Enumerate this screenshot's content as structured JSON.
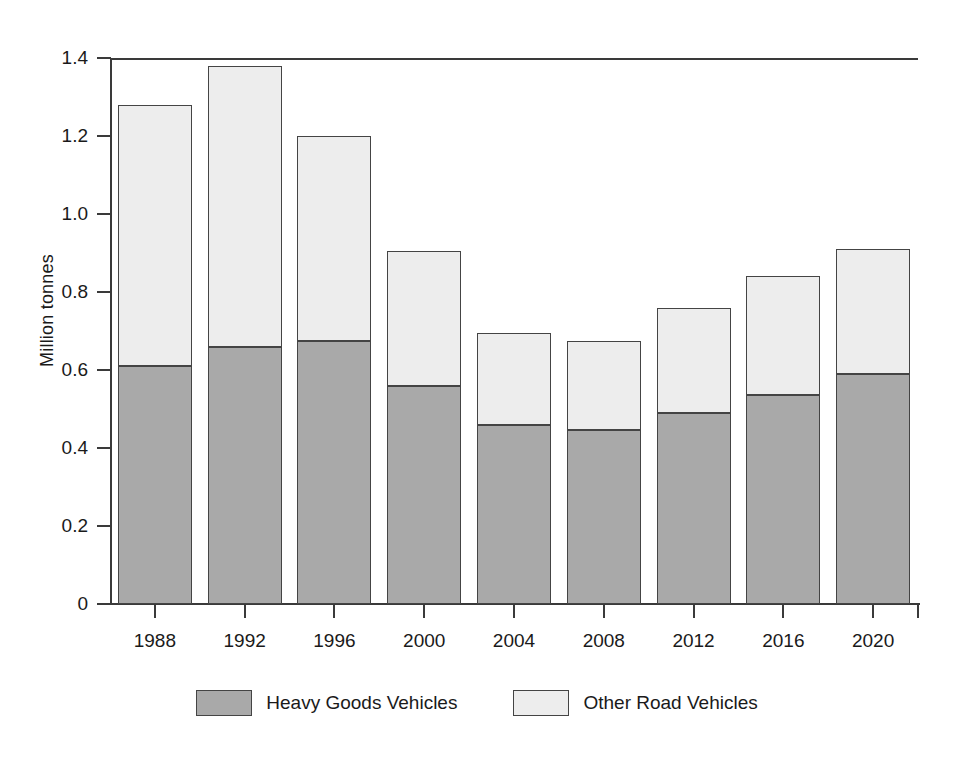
{
  "chart_data": {
    "type": "bar",
    "subtype": "stacked-bar",
    "title": "",
    "xlabel": "",
    "ylabel": "Million tonnes",
    "categories": [
      "1988",
      "1992",
      "1996",
      "2000",
      "2004",
      "2008",
      "2012",
      "2016",
      "2020"
    ],
    "series": [
      {
        "name": "Heavy Goods Vehicles",
        "color": "#a9a9a9",
        "values": [
          0.61,
          0.66,
          0.675,
          0.56,
          0.46,
          0.445,
          0.49,
          0.535,
          0.59
        ]
      },
      {
        "name": "Other Road Vehicles",
        "color": "#ededed",
        "values": [
          0.67,
          0.72,
          0.525,
          0.345,
          0.235,
          0.23,
          0.27,
          0.305,
          0.32
        ]
      }
    ],
    "totals": [
      1.28,
      1.38,
      1.2,
      0.905,
      0.695,
      0.675,
      0.76,
      0.84,
      0.91
    ],
    "ylim": [
      0,
      1.4
    ],
    "y_ticks": [
      0,
      0.2,
      0.4,
      0.6,
      0.8,
      1.0,
      1.2,
      1.4
    ],
    "y_tick_labels": [
      "0",
      "0.2",
      "0.4",
      "0.6",
      "0.8",
      "1.0",
      "1.2",
      "1.4"
    ],
    "grid": false,
    "legend_position": "bottom"
  },
  "legend": {
    "items": [
      {
        "label": "Heavy Goods Vehicles",
        "color": "#a9a9a9"
      },
      {
        "label": "Other Road Vehicles",
        "color": "#ededed"
      }
    ]
  },
  "axes": {
    "y_title": "Million tonnes"
  }
}
